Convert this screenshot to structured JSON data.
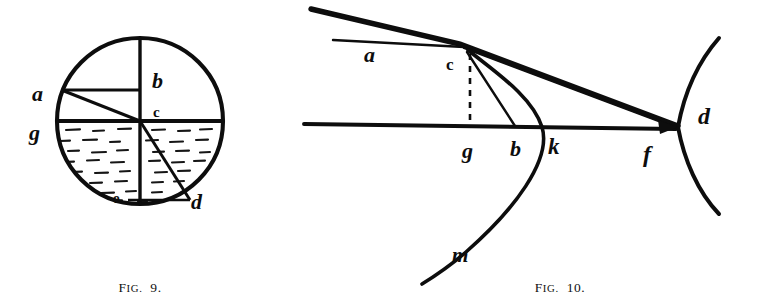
{
  "page": {
    "background_color": "#ffffff",
    "ink_color": "#0d0d0d",
    "width": 758,
    "height": 307
  },
  "figures": [
    {
      "id": "fig9",
      "caption": "Fig.",
      "caption_prefix": "F",
      "caption_small": "IG.",
      "caption_number": "9.",
      "caption_full": "FIG. 9.",
      "description": "Circle partially filled with hatched liquid, divided by a vertical diameter and a horizontal water line, with a chord from a to the centre c and a radius from c to d",
      "labels": [
        {
          "key": "a",
          "text": "a",
          "style": "script",
          "x": 38,
          "y": 95
        },
        {
          "key": "b",
          "text": "b",
          "style": "script",
          "x": 160,
          "y": 80
        },
        {
          "key": "c",
          "text": "c",
          "style": "roman",
          "x": 158,
          "y": 117
        },
        {
          "key": "g",
          "text": "g",
          "style": "script",
          "x": 35,
          "y": 136
        },
        {
          "key": "e",
          "text": "e",
          "style": "roman",
          "x": 117,
          "y": 202
        },
        {
          "key": "d",
          "text": "d",
          "style": "script",
          "x": 196,
          "y": 206
        }
      ]
    },
    {
      "id": "fig10",
      "caption": "Fig.",
      "caption_prefix": "F",
      "caption_small": "IG.",
      "caption_number": "10.",
      "caption_full": "FIG. 10.",
      "description": "Ray diagram: an incident ray meets a refracting surface at c; the horizontal axis runs through g, b, k and f to the point d at the vertex of the right-hand curve; the parabolic curve through k descends to m",
      "labels": [
        {
          "key": "a",
          "text": "a",
          "style": "script",
          "x": 371,
          "y": 62
        },
        {
          "key": "c",
          "text": "c",
          "style": "roman",
          "x": 469,
          "y": 70
        },
        {
          "key": "g",
          "text": "g",
          "style": "script",
          "x": 481,
          "y": 155
        },
        {
          "key": "b",
          "text": "b",
          "style": "script",
          "x": 528,
          "y": 153
        },
        {
          "key": "k",
          "text": "k",
          "style": "script",
          "x": 570,
          "y": 150
        },
        {
          "key": "f",
          "text": "f",
          "style": "script",
          "x": 660,
          "y": 160
        },
        {
          "key": "d",
          "text": "d",
          "style": "script",
          "x": 712,
          "y": 116
        },
        {
          "key": "m",
          "text": "m",
          "style": "script",
          "x": 472,
          "y": 256
        }
      ]
    }
  ]
}
